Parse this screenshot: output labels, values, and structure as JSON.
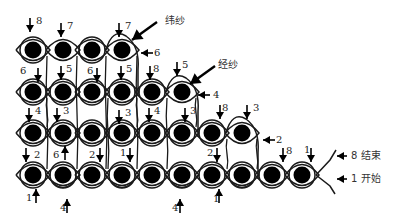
{
  "diagram": {
    "colors": {
      "stroke": "#1a1a1a",
      "dot": "#000000",
      "background": "#ffffff",
      "text": "#222222"
    },
    "rows": [
      {
        "y": 50,
        "xs": [
          33,
          63,
          92,
          122
        ],
        "ringed": [
          true,
          false,
          true,
          false
        ]
      },
      {
        "y": 92,
        "xs": [
          33,
          63,
          92,
          122,
          152,
          182
        ],
        "ringed": [
          true,
          true,
          true,
          true,
          true,
          false
        ]
      },
      {
        "y": 133,
        "xs": [
          33,
          63,
          92,
          122,
          152,
          182,
          212,
          242
        ],
        "ringed": [
          true,
          true,
          true,
          true,
          true,
          true,
          true,
          false
        ]
      },
      {
        "y": 175,
        "xs": [
          33,
          63,
          92,
          122,
          152,
          182,
          212,
          242,
          272,
          302
        ],
        "ringed": [
          true,
          true,
          true,
          true,
          true,
          true,
          true,
          true,
          true,
          true
        ]
      }
    ],
    "annotations": {
      "weft_yarn": "纬纱",
      "warp_yarn": "经纱",
      "end_label": "8 结束",
      "start_label": "1 开始"
    },
    "step_labels": [
      {
        "text": "8",
        "x": 36,
        "y": 16,
        "dir": "down",
        "ax": 30,
        "ay": 18
      },
      {
        "text": "7",
        "x": 67,
        "y": 21,
        "dir": "down",
        "ax": 61,
        "ay": 23
      },
      {
        "text": "7",
        "x": 125,
        "y": 21,
        "dir": "down",
        "ax": 119,
        "ay": 23
      },
      {
        "text": "6",
        "x": 154,
        "y": 48,
        "dir": "left",
        "ax": 143,
        "ay": 53
      },
      {
        "text": "6",
        "x": 20,
        "y": 66,
        "dir": "down",
        "ax": 38,
        "ay": 68
      },
      {
        "text": "5",
        "x": 66,
        "y": 64,
        "dir": "down",
        "ax": 61,
        "ay": 66
      },
      {
        "text": "6",
        "x": 87,
        "y": 66,
        "dir": "down",
        "ax": 97,
        "ay": 68
      },
      {
        "text": "5",
        "x": 126,
        "y": 64,
        "dir": "down",
        "ax": 121,
        "ay": 66
      },
      {
        "text": "8",
        "x": 153,
        "y": 64,
        "dir": "down",
        "ax": 150,
        "ay": 66
      },
      {
        "text": "5",
        "x": 182,
        "y": 60,
        "dir": "down",
        "ax": 177,
        "ay": 62
      },
      {
        "text": "4",
        "x": 213,
        "y": 90,
        "dir": "left",
        "ax": 200,
        "ay": 95
      },
      {
        "text": "4",
        "x": 35,
        "y": 106,
        "dir": "down",
        "ax": 29,
        "ay": 108
      },
      {
        "text": "3",
        "x": 63,
        "y": 106,
        "dir": "down",
        "ax": 57,
        "ay": 108
      },
      {
        "text": "3",
        "x": 125,
        "y": 108,
        "dir": "down",
        "ax": 119,
        "ay": 110
      },
      {
        "text": "4",
        "x": 154,
        "y": 106,
        "dir": "down",
        "ax": 149,
        "ay": 108
      },
      {
        "text": "3",
        "x": 190,
        "y": 106,
        "dir": "down",
        "ax": 185,
        "ay": 108
      },
      {
        "text": "8",
        "x": 222,
        "y": 103,
        "dir": "down",
        "ax": 220,
        "ay": 105
      },
      {
        "text": "3",
        "x": 253,
        "y": 103,
        "dir": "down",
        "ax": 247,
        "ay": 105
      },
      {
        "text": "2",
        "x": 276,
        "y": 135,
        "dir": "left",
        "ax": 265,
        "ay": 140
      },
      {
        "text": "2",
        "x": 34,
        "y": 150,
        "dir": "down",
        "ax": 26,
        "ay": 148
      },
      {
        "text": "6",
        "x": 53,
        "y": 150,
        "dir": "up",
        "ax": 65,
        "ay": 160
      },
      {
        "text": "2",
        "x": 89,
        "y": 150,
        "dir": "down",
        "ax": 100,
        "ay": 148
      },
      {
        "text": "1",
        "x": 120,
        "y": 148,
        "dir": "down",
        "ax": 130,
        "ay": 148
      },
      {
        "text": "2",
        "x": 207,
        "y": 148,
        "dir": "down",
        "ax": 217,
        "ay": 148
      },
      {
        "text": "8",
        "x": 286,
        "y": 146,
        "dir": "down",
        "ax": 283,
        "ay": 148
      },
      {
        "text": "1",
        "x": 304,
        "y": 145,
        "dir": "down",
        "ax": 311,
        "ay": 148
      },
      {
        "text": "1",
        "x": 26,
        "y": 193,
        "dir": "up",
        "ax": 36,
        "ay": 203
      },
      {
        "text": "4",
        "x": 60,
        "y": 203,
        "dir": "up",
        "ax": 67,
        "ay": 213
      },
      {
        "text": "4",
        "x": 172,
        "y": 203,
        "dir": "up",
        "ax": 180,
        "ay": 213
      },
      {
        "text": "1",
        "x": 213,
        "y": 194,
        "dir": "up",
        "ax": 219,
        "ay": 203
      }
    ]
  }
}
